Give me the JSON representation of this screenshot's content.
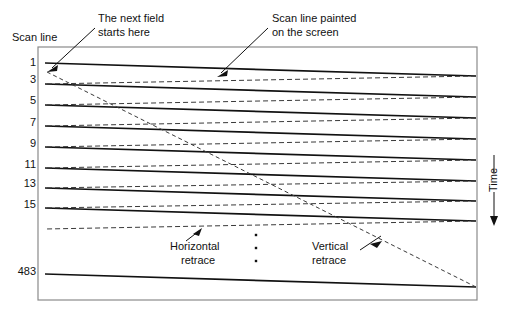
{
  "figure": {
    "title_axis_label": "Scan line",
    "time_label": "Time"
  },
  "annotations": {
    "next_field": {
      "line1": "The next field",
      "line2": "starts here"
    },
    "scan_line_painted": {
      "line1": "Scan line painted",
      "line2": "on the screen"
    },
    "horizontal_retrace": {
      "line1": "Horizontal",
      "line2": "retrace"
    },
    "vertical_retrace": {
      "line1": "Vertical",
      "line2": "retrace"
    }
  },
  "chart_data": {
    "type": "line",
    "xlabel": "",
    "ylabel": "Scan line",
    "grid": false,
    "legend": false,
    "scan_line_labels": [
      "1",
      "3",
      "5",
      "7",
      "9",
      "11",
      "13",
      "15",
      "483"
    ],
    "scan_line_label_y": [
      66,
      83,
      104,
      126,
      147,
      168,
      187,
      208,
      275
    ],
    "scan_lines": [
      {
        "label": "1",
        "x1": 45,
        "y1": 63,
        "x2": 476,
        "y2": 76
      },
      {
        "label": "3",
        "x1": 45,
        "y1": 84,
        "x2": 476,
        "y2": 97
      },
      {
        "label": "5",
        "x1": 45,
        "y1": 105,
        "x2": 476,
        "y2": 118
      },
      {
        "label": "7",
        "x1": 45,
        "y1": 126,
        "x2": 476,
        "y2": 139
      },
      {
        "label": "9",
        "x1": 45,
        "y1": 147,
        "x2": 476,
        "y2": 160
      },
      {
        "label": "11",
        "x1": 45,
        "y1": 168,
        "x2": 476,
        "y2": 181
      },
      {
        "label": "13",
        "x1": 45,
        "y1": 188,
        "x2": 476,
        "y2": 201
      },
      {
        "label": "15",
        "x1": 45,
        "y1": 208,
        "x2": 476,
        "y2": 221
      },
      {
        "label": "483",
        "x1": 45,
        "y1": 274,
        "x2": 476,
        "y2": 287
      }
    ],
    "horizontal_retraces": [
      {
        "x1": 476,
        "y1": 76,
        "x2": 45,
        "y2": 84
      },
      {
        "x1": 476,
        "y1": 97,
        "x2": 45,
        "y2": 105
      },
      {
        "x1": 476,
        "y1": 118,
        "x2": 45,
        "y2": 126
      },
      {
        "x1": 476,
        "y1": 139,
        "x2": 45,
        "y2": 147
      },
      {
        "x1": 476,
        "y1": 160,
        "x2": 45,
        "y2": 168
      },
      {
        "x1": 476,
        "y1": 181,
        "x2": 45,
        "y2": 188
      },
      {
        "x1": 476,
        "y1": 201,
        "x2": 45,
        "y2": 208
      },
      {
        "x1": 476,
        "y1": 221,
        "x2": 45,
        "y2": 229
      }
    ],
    "vertical_retrace": {
      "x1": 476,
      "y1": 287,
      "x2": 47,
      "y2": 72
    },
    "ellipsis_dots_x": [
      256,
      256,
      256
    ],
    "ellipsis_dots_y": [
      235,
      248,
      261
    ],
    "frame": {
      "x": 38,
      "y": 47,
      "width": 439,
      "height": 253
    },
    "axis_ranges": {
      "x": [
        38,
        477
      ],
      "y": [
        47,
        300
      ]
    }
  }
}
